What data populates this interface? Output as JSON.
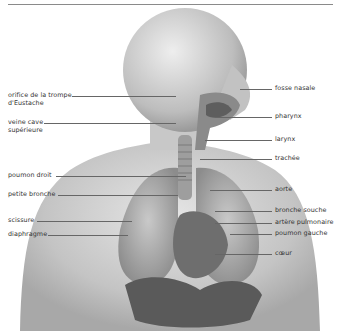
{
  "figure": {
    "labels_left": [
      {
        "text": "orifice de la trompe",
        "text2": "d'Eustache"
      },
      {
        "text": "veine cave",
        "text2": "supérieure"
      },
      {
        "text": "poumon droit"
      },
      {
        "text": "petite bronche"
      },
      {
        "text": "scissure"
      },
      {
        "text": "diaphragme"
      }
    ],
    "labels_right": [
      {
        "text": "fosse nasale"
      },
      {
        "text": "pharynx"
      },
      {
        "text": "larynx"
      },
      {
        "text": "trachée"
      },
      {
        "text": "aorte"
      },
      {
        "text": "bronche souche"
      },
      {
        "text": "artère pulmonaire"
      },
      {
        "text": "poumon gauche"
      },
      {
        "text": "cœur"
      }
    ]
  },
  "colors": {
    "rule": "#8a8a8a",
    "label": "#333333",
    "leader": "#666666"
  }
}
